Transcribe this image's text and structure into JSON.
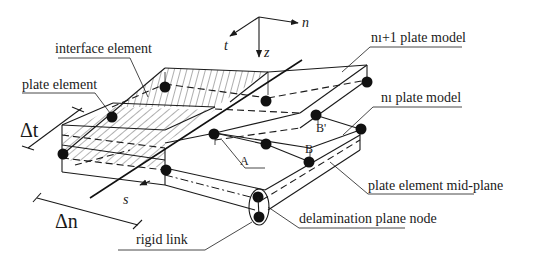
{
  "diagram": {
    "axes": {
      "n": "n",
      "t": "t",
      "z": "z",
      "s": "s"
    },
    "dimensions": {
      "delta_t": "Δt",
      "delta_n": "Δn"
    },
    "points": {
      "A": "A",
      "B": "B",
      "B_prime": "B'"
    },
    "labels": {
      "interface_element": "interface element",
      "plate_element": "plate element",
      "upper_plate": "nı+1 plate model",
      "lower_plate": "nı plate model",
      "mid_plane": "plate element mid-plane",
      "delamination_node": "delamination plane node",
      "rigid_link": "rigid link"
    },
    "colors": {
      "line": "#1a1a1a",
      "background": "#ffffff"
    }
  }
}
